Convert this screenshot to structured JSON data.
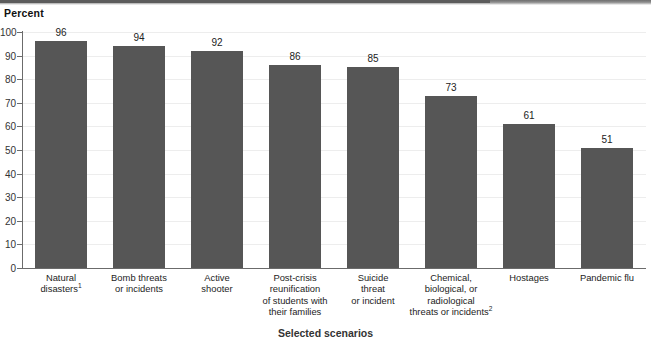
{
  "chart_data": {
    "type": "bar",
    "title": "",
    "ylabel": "Percent",
    "xlabel": "Selected scenarios",
    "ylim": [
      0,
      100
    ],
    "ytick_step": 10,
    "yticks": [
      0,
      10,
      20,
      30,
      40,
      50,
      60,
      70,
      80,
      90,
      100
    ],
    "grid": true,
    "legend": null,
    "bar_color": "#565656",
    "categories": [
      "Natural disasters",
      "Bomb threats or incidents",
      "Active shooter",
      "Post-crisis reunification of students with their families",
      "Suicide threat or incident",
      "Chemical, biological, or radiological threats or incidents",
      "Hostages",
      "Pandemic flu"
    ],
    "category_lines": [
      [
        "Natural",
        "disasters"
      ],
      [
        "Bomb threats",
        "or incidents"
      ],
      [
        "Active",
        "shooter"
      ],
      [
        "Post-crisis",
        "reunification",
        "of students with",
        "their families"
      ],
      [
        "Suicide",
        "threat",
        "or incident"
      ],
      [
        "Chemical,",
        "biological, or",
        "radiological",
        "threats or incidents"
      ],
      [
        "Hostages"
      ],
      [
        "Pandemic flu"
      ]
    ],
    "category_footnotes": [
      "1",
      "",
      "",
      "",
      "",
      "2",
      "",
      ""
    ],
    "values": [
      96,
      94,
      92,
      86,
      85,
      73,
      61,
      51
    ],
    "value_labels": [
      "96",
      "94",
      "92",
      "86",
      "85",
      "73",
      "61",
      "51"
    ]
  }
}
